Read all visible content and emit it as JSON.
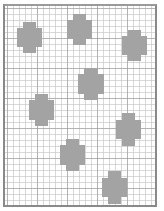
{
  "diagram": {
    "type": "grid-pattern",
    "frame": {
      "left": 3,
      "top": 4,
      "width": 154,
      "height": 203,
      "border_color": "#8a8a8a"
    },
    "grid": {
      "minor_spacing": 6,
      "major_spacing": 30,
      "line_color": "#c8c8c8"
    },
    "blob_color": "#a3a3a3",
    "blobs": [
      {
        "id": "A",
        "x": 17,
        "y": 22,
        "w": 25,
        "h": 31
      },
      {
        "id": "B",
        "x": 67,
        "y": 14,
        "w": 25,
        "h": 31
      },
      {
        "id": "C",
        "x": 122,
        "y": 30,
        "w": 25,
        "h": 31
      },
      {
        "id": "D",
        "x": 78,
        "y": 68,
        "w": 26,
        "h": 32
      },
      {
        "id": "E",
        "x": 29,
        "y": 94,
        "w": 25,
        "h": 32
      },
      {
        "id": "F",
        "x": 116,
        "y": 113,
        "w": 25,
        "h": 33
      },
      {
        "id": "G",
        "x": 60,
        "y": 139,
        "w": 25,
        "h": 32
      },
      {
        "id": "H",
        "x": 102,
        "y": 171,
        "w": 25,
        "h": 33
      }
    ]
  }
}
